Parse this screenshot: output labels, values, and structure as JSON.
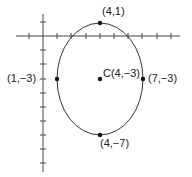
{
  "diagram": {
    "type": "ellipse-on-axes",
    "center": {
      "label": "C(4,−3)",
      "x": 4,
      "y": -3
    },
    "points": [
      {
        "name": "top-vertex",
        "label": "(4,1)",
        "x": 4,
        "y": 1
      },
      {
        "name": "bottom-vertex",
        "label": "(4,−7)",
        "x": 4,
        "y": -7
      },
      {
        "name": "left-covertex",
        "label": "(1,−3)",
        "x": 1,
        "y": -3
      },
      {
        "name": "right-covertex",
        "label": "(7,−3)",
        "x": 7,
        "y": -3
      }
    ],
    "colors": {
      "stroke": "#333333",
      "point": "#111111"
    }
  }
}
